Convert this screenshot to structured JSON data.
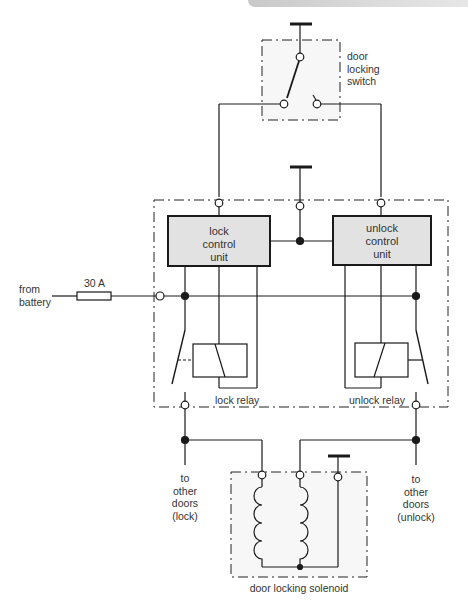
{
  "diagram": {
    "type": "circuit-diagram",
    "colors": {
      "line": "#1a1a1a",
      "unit_fill": "#e2e2e2",
      "box_fill": "#f7f7f7",
      "text": "#333333",
      "top_bar": "#d6d6d6"
    }
  },
  "labels": {
    "switch": [
      "door",
      "locking",
      "switch"
    ],
    "lock_unit": [
      "lock",
      "control",
      "unit"
    ],
    "unlock_unit": [
      "unlock",
      "control",
      "unit"
    ],
    "battery": [
      "from",
      "battery"
    ],
    "fuse": "30 A",
    "lock_relay": "lock relay",
    "unlock_relay": "unlock relay",
    "other_lock": [
      "to",
      "other",
      "doors",
      "(lock)"
    ],
    "other_unlock": [
      "to",
      "other",
      "doors",
      "(unlock)"
    ],
    "solenoid": "door locking solenoid"
  },
  "components": [
    {
      "id": "door-locking-switch",
      "kind": "switch",
      "label": "door locking switch"
    },
    {
      "id": "lock-control-unit",
      "kind": "control-unit",
      "label": "lock control unit"
    },
    {
      "id": "unlock-control-unit",
      "kind": "control-unit",
      "label": "unlock control unit"
    },
    {
      "id": "fuse",
      "kind": "fuse",
      "rating": "30 A"
    },
    {
      "id": "lock-relay",
      "kind": "relay",
      "label": "lock relay"
    },
    {
      "id": "unlock-relay",
      "kind": "relay",
      "label": "unlock relay"
    },
    {
      "id": "door-locking-solenoid",
      "kind": "solenoid",
      "label": "door locking solenoid",
      "coils": 2
    },
    {
      "id": "ground-top",
      "kind": "earth"
    },
    {
      "id": "ground-unit",
      "kind": "earth"
    },
    {
      "id": "ground-solenoid",
      "kind": "earth"
    }
  ]
}
